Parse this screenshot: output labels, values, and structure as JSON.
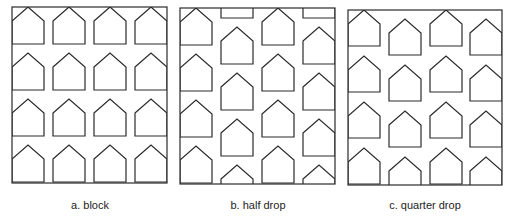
{
  "figure": {
    "panels": [
      {
        "id": "block",
        "caption": "a.  block",
        "frame": {
          "x": 12,
          "y": 7,
          "w": 155,
          "h": 176
        },
        "columns_x": [
          12,
          53,
          94,
          135
        ],
        "column_offsets": [
          0,
          0,
          0,
          0
        ],
        "row_pitch": 46,
        "house": {
          "w": 32,
          "roof": 14,
          "body": 23
        }
      },
      {
        "id": "half-drop",
        "caption": "b.  half drop",
        "frame": {
          "x": 180,
          "y": 8,
          "w": 155,
          "h": 176
        },
        "columns_x": [
          180,
          221,
          262,
          303
        ],
        "column_offsets": [
          0,
          19,
          0,
          19
        ],
        "row_pitch": 46,
        "house": {
          "w": 32,
          "roof": 14,
          "body": 23
        }
      },
      {
        "id": "quarter-drop",
        "caption": "c.  quarter drop",
        "frame": {
          "x": 348,
          "y": 10,
          "w": 154,
          "h": 175
        },
        "columns_x": [
          348,
          389,
          430,
          470
        ],
        "column_offsets": [
          0,
          9,
          0,
          9
        ],
        "row_pitch": 46,
        "house": {
          "w": 32,
          "roof": 14,
          "body": 22
        }
      }
    ]
  }
}
